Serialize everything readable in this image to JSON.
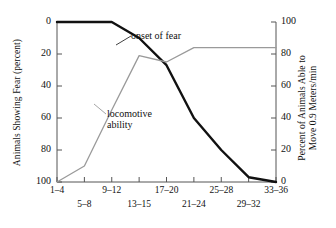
{
  "chart_data": {
    "type": "line",
    "title": "",
    "xlabel": "",
    "categories": [
      "1–4",
      "5–8",
      "9–12",
      "13–15",
      "17–20",
      "21–24",
      "25–28",
      "29–32",
      "33–36"
    ],
    "x_tick_labels_upper": [
      "1–4",
      "9–12",
      "17–20",
      "25–28",
      "33–36"
    ],
    "x_tick_labels_lower": [
      "5–8",
      "13–15",
      "21–24",
      "29–32"
    ],
    "grid": false,
    "legend_position": "inline-annotations",
    "left_axis": {
      "label": "Animals Showing Fear (percent)",
      "ticks": [
        0,
        20,
        40,
        60,
        80,
        100
      ],
      "range": [
        0,
        100
      ],
      "inverted": true
    },
    "right_axis": {
      "label_line1": "Percent of Animals Able to",
      "label_line2": "Move 0.9 Meters/min",
      "ticks": [
        100,
        80,
        60,
        40,
        20,
        0
      ],
      "range": [
        0,
        100
      ],
      "inverted": false
    },
    "series": [
      {
        "name": "onset of fear",
        "axis": "left",
        "color": "#111111",
        "width": 2.4,
        "values": [
          0,
          0,
          0,
          10,
          27,
          60,
          80,
          97,
          100
        ]
      },
      {
        "name": "locomotive ability",
        "axis": "right",
        "color": "#9a9a9a",
        "width": 1.3,
        "values": [
          0,
          10,
          45,
          79,
          75,
          84,
          84,
          84,
          84
        ]
      }
    ],
    "annotations": [
      {
        "text": "onset of fear",
        "series": "onset of fear"
      },
      {
        "text_line1": "locomotive",
        "text_line2": "ability",
        "series": "locomotive ability"
      }
    ]
  },
  "colors": {
    "fear_curve": "#111111",
    "locomotive_curve": "#9a9a9a",
    "axis": "#555555",
    "text": "#111111",
    "background": "#ffffff"
  }
}
